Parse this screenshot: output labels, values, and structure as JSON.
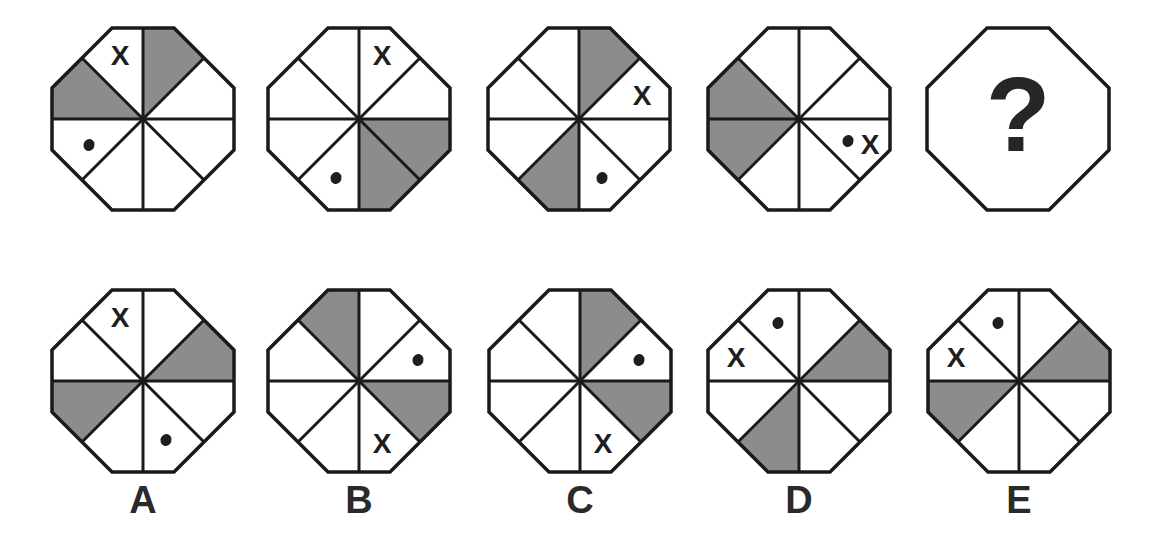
{
  "colors": {
    "stroke": "#1a1a1a",
    "shade": "#8c8c8c",
    "fill": "#ffffff",
    "mark": "#1e1e1e"
  },
  "sector_names": [
    "top-right",
    "right-upper",
    "right-lower",
    "bottom-right",
    "bottom-left",
    "left-lower",
    "left-upper",
    "top-left"
  ],
  "sequence": [
    {
      "id": "seq-1",
      "x": 52,
      "y": 28,
      "shaded": [
        7,
        6
      ],
      "shaded_note": "top-right & left-upper",
      "shaded_sectors": [
        0,
        6
      ],
      "x_sector": 7,
      "dot_sector": 5,
      "mark_x": "X"
    },
    {
      "id": "seq-2",
      "x": 268,
      "y": 28,
      "shaded_sectors": [
        2,
        3
      ],
      "x_sector": 0,
      "dot_sector": 4,
      "mark_x": "X"
    },
    {
      "id": "seq-3",
      "x": 488,
      "y": 28,
      "shaded_sectors": [
        0,
        4
      ],
      "x_sector": 1,
      "dot_sector": 3,
      "mark_x": "X"
    },
    {
      "id": "seq-4",
      "x": 708,
      "y": 28,
      "shaded_sectors": [
        5,
        6
      ],
      "x_sector": 2,
      "dot_sector": 2,
      "combined": true,
      "mark_x": "X"
    },
    {
      "id": "seq-5",
      "x": 927,
      "y": 28,
      "question": "?"
    }
  ],
  "options": [
    {
      "label": "A",
      "x": 52,
      "y": 290,
      "shaded_sectors": [
        1,
        5
      ],
      "x_sector": 7,
      "dot_sector": 3,
      "mark_x": "X"
    },
    {
      "label": "B",
      "x": 268,
      "y": 290,
      "shaded_sectors": [
        7,
        2
      ],
      "x_sector": 3,
      "dot_sector": 1,
      "mark_x": "X"
    },
    {
      "label": "C",
      "x": 489,
      "y": 290,
      "shaded_sectors": [
        0,
        2
      ],
      "x_sector": 3,
      "dot_sector": 1,
      "mark_x": "X"
    },
    {
      "label": "D",
      "x": 708,
      "y": 290,
      "shaded_sectors": [
        1,
        4
      ],
      "x_sector": 6,
      "dot_sector": 7,
      "mark_x": "X"
    },
    {
      "label": "E",
      "x": 928,
      "y": 290,
      "shaded_sectors": [
        1,
        5
      ],
      "x_sector": 6,
      "dot_sector": 7,
      "mark_x": "X"
    }
  ],
  "label_y": 481
}
